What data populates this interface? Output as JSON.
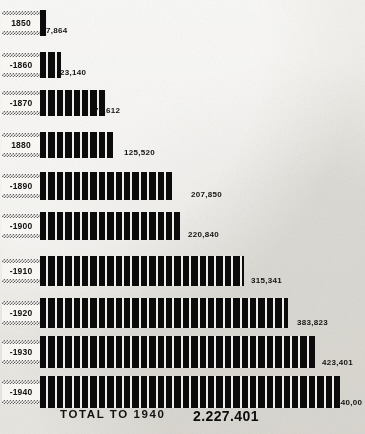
{
  "chart_data": {
    "type": "bar",
    "title": "",
    "orientation": "horizontal",
    "xlabel": "",
    "ylabel": "",
    "categories": [
      "1850",
      "-1860",
      "-1870",
      "1880",
      "-1890",
      "-1900",
      "-1910",
      "-1920",
      "-1930",
      "-1940"
    ],
    "values": [
      7864,
      23140,
      79612,
      125520,
      207850,
      220840,
      315341,
      383823,
      423401,
      440000
    ],
    "value_labels": [
      "7,864",
      "23,140",
      "79,612",
      "125,520",
      "207,850",
      "220,840",
      "315,341",
      "383,823",
      "423,401",
      "440,00"
    ],
    "xlim": [
      0,
      440000
    ],
    "grid": false,
    "legend": false,
    "bar_style": "vertical-striped-blocks",
    "note_last_label_clipped": "440,00 is clipped at the right edge of the image"
  },
  "rows": [
    {
      "year": "1850",
      "value_label": "7,864",
      "bar_px": 7,
      "label_x": 46
    },
    {
      "year": "-1860",
      "value_label": "23,140",
      "bar_px": 21,
      "label_x": 60
    },
    {
      "year": "-1870",
      "value_label": "79,612",
      "bar_px": 66,
      "label_x": 94
    },
    {
      "year": "1880",
      "value_label": "125,520",
      "bar_px": 73,
      "label_x": 124
    },
    {
      "year": "-1890",
      "value_label": "207,850",
      "bar_px": 132,
      "label_x": 191
    },
    {
      "year": "-1900",
      "value_label": "220,840",
      "bar_px": 140,
      "label_x": 188
    },
    {
      "year": "-1910",
      "value_label": "315,341",
      "bar_px": 204,
      "label_x": 251
    },
    {
      "year": "-1920",
      "value_label": "383,823",
      "bar_px": 248,
      "label_x": 297
    },
    {
      "year": "-1930",
      "value_label": "423,401",
      "bar_px": 275,
      "label_x": 322
    },
    {
      "year": "-1940",
      "value_label": "440,00",
      "bar_px": 300,
      "label_x": 336
    }
  ],
  "footer": {
    "total_label": "TOTAL TO 1940",
    "total_value": "2.227.401"
  },
  "colors": {
    "bar": "#0b0b0b",
    "paper": "#efeeea",
    "text": "#121212"
  }
}
